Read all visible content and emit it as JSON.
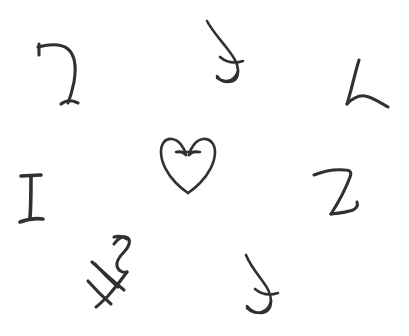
{
  "canvas": {
    "width": 409,
    "height": 336,
    "background_color": "#ffffff",
    "ink_color": "#33312f",
    "medium": "pen-on-paper",
    "description": "Eight hand-drawn abstract glyph symbols scattered on a blank white page"
  },
  "glyphs": [
    {
      "id": "glyph-hook-seven",
      "label": "hook-seven-glyph",
      "resembles": "7",
      "position": {
        "x": 36,
        "y": 40,
        "width": 45,
        "height": 64
      },
      "stroke_weight": "medium",
      "notes": "Short serif tick at upper left, horizontal top bar curving down into a long right-leaning stem ending in a small foot serif"
    },
    {
      "id": "glyph-jay-cross-top",
      "label": "jay-with-crossbar-glyph-upper",
      "resembles": "J",
      "position": {
        "x": 199,
        "y": 18,
        "width": 45,
        "height": 64
      },
      "stroke_weight": "thin",
      "notes": "Descending curve hooking left at the bottom, intersected by a short horizontal crossbar near the lower third"
    },
    {
      "id": "glyph-ell-curved-foot",
      "label": "ell-curved-foot-glyph",
      "resembles": "L",
      "position": {
        "x": 344,
        "y": 58,
        "width": 48,
        "height": 48
      },
      "stroke_weight": "medium",
      "notes": "Vertical stem bending at the base into a shallow upward-sweeping curved foot to the right"
    },
    {
      "id": "glyph-heart-outline",
      "label": "heart-outline-with-bar-glyph",
      "resembles": "heart",
      "position": {
        "x": 161,
        "y": 136,
        "width": 58,
        "height": 56
      },
      "stroke_weight": "thin",
      "notes": "Open heart or V outline; two small inward curls at the top lobes joined by a short horizontal bar, tails left unclosed at the bottom point"
    },
    {
      "id": "glyph-serif-eye",
      "label": "serif-i-glyph",
      "resembles": "I",
      "position": {
        "x": 19,
        "y": 173,
        "width": 25,
        "height": 53
      },
      "stroke_weight": "thick",
      "notes": "Upright stem with a straight top serif bar and a slanted bottom serif bar"
    },
    {
      "id": "glyph-zed-tail",
      "label": "zed-with-tail-glyph",
      "resembles": "Z",
      "position": {
        "x": 312,
        "y": 167,
        "width": 48,
        "height": 52
      },
      "stroke_weight": "medium",
      "notes": "Angular Z form with a flat top stroke, steep diagonal, and a baseline that lifts into a small hooked tail at the right"
    },
    {
      "id": "glyph-crossed-ess",
      "label": "crossed-ess-diagonal-glyph",
      "resembles": "S over H",
      "position": {
        "x": 92,
        "y": 232,
        "width": 45,
        "height": 76
      },
      "stroke_weight": "medium",
      "notes": "S or 5 shaped top flowing into a long diagonal stem, crossed near the bottom by two short parallel strokes forming a rotated H"
    },
    {
      "id": "glyph-jay-cross-bottom",
      "label": "jay-with-crossbar-glyph-lower",
      "resembles": "J",
      "position": {
        "x": 238,
        "y": 252,
        "width": 42,
        "height": 62
      },
      "stroke_weight": "thin",
      "notes": "Descending curve hooking left at the bottom, intersected by a short horizontal crossbar near the lower third"
    }
  ],
  "summary": {
    "glyph_count": 8,
    "layout": "loosely scattered, roughly two rows across the top and middle with two glyphs along the bottom",
    "text_present": "none"
  }
}
